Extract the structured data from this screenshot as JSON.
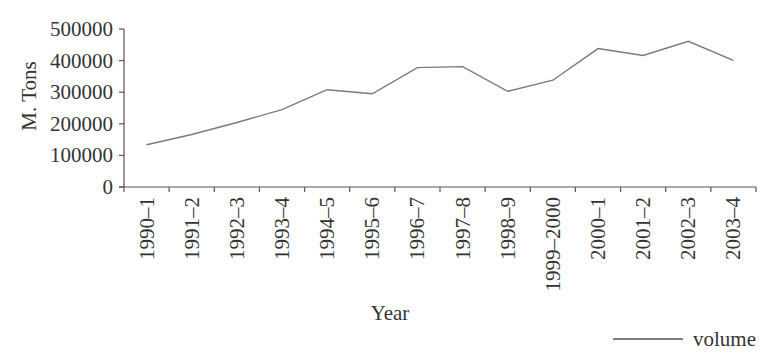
{
  "chart_data": {
    "type": "line",
    "title": "",
    "xlabel": "Year",
    "ylabel": "M. Tons",
    "ylim": [
      0,
      500000
    ],
    "yticks": [
      0,
      100000,
      200000,
      300000,
      400000,
      500000
    ],
    "ytick_labels": [
      "0",
      "100000",
      "200000",
      "300000",
      "400000",
      "500000"
    ],
    "categories": [
      "1990–1",
      "1991–2",
      "1992–3",
      "1993–4",
      "1994–5",
      "1995–6",
      "1996–7",
      "1997–8",
      "1998–9",
      "1999–2000",
      "2000–1",
      "2001–2",
      "2002–3",
      "2003–4"
    ],
    "series": [
      {
        "name": "volume",
        "values": [
          134000,
          166000,
          204000,
          245000,
          308000,
          295000,
          378000,
          381000,
          303000,
          338000,
          438000,
          416000,
          461000,
          401000
        ],
        "color": "#7a7a7a"
      }
    ],
    "grid": false,
    "legend_position": "bottom-right"
  },
  "colors": {
    "text": "#333333",
    "axis": "#555555",
    "line": "#7a7a7a"
  }
}
